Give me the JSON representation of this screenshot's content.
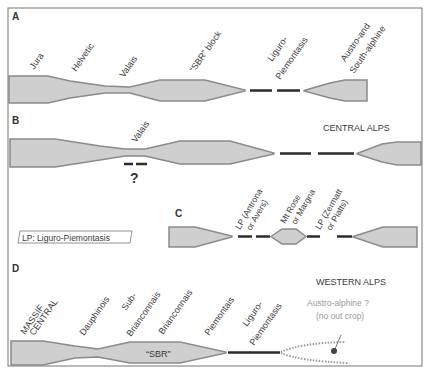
{
  "colors": {
    "frame": "#6b6b6b",
    "fill": "#cfcfcf",
    "outline": "#8a8a8a",
    "text": "#3a3a3a",
    "muted_text": "#9a9a9a",
    "dash": "#2b2b2b"
  },
  "panels": {
    "A": {
      "letter": "A",
      "labels": [
        "Jura",
        "Helvetic",
        "Valais",
        "“SBR” block",
        "Liguro-",
        "Piemontasis",
        "Austro-and",
        "South-alphine"
      ]
    },
    "B": {
      "letter": "B",
      "region": "CENTRAL ALPS",
      "labels": [
        "Valais"
      ],
      "question": "?"
    },
    "C": {
      "letter": "C",
      "labels": [
        "LP (Antrona",
        "or Avers)",
        "Mt Rose",
        "or Margna",
        "LP (Zermatt",
        "or Piatts)"
      ],
      "legend": "LP: Liguro-Piemontasis"
    },
    "D": {
      "letter": "D",
      "region": "WESTERN ALPS",
      "labels": [
        "MASSIF",
        "CENTRAL",
        "Dauphinois",
        "Sub-",
        "Brianconnais",
        "Brianconnais",
        "Piemontais",
        "Liguro-",
        "Piemontasis"
      ],
      "block_label": "“SBR”",
      "austro_line1": "Austro-alphine ?",
      "austro_line2": "(no out crop)"
    }
  }
}
